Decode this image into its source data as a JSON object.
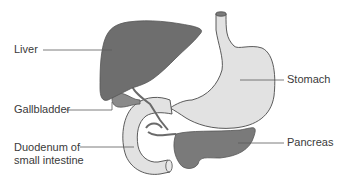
{
  "diagram": {
    "labels": {
      "liver": "Liver",
      "gallbladder": "Gallbladder",
      "duodenum_line1": "Duodenum of",
      "duodenum_line2": "small intestine",
      "stomach": "Stomach",
      "pancreas": "Pancreas"
    },
    "colors": {
      "liver": "#6e6e6e",
      "gallbladder": "#8a8a8a",
      "stomach": "#e2e2e2",
      "duodenum": "#e2e2e2",
      "pancreas": "#7a7a7a",
      "duct": "#6a6a6a",
      "outline": "#4a4a4a",
      "leader_line": "#5a5a5a",
      "text": "#3a3a3a",
      "background": "#ffffff"
    }
  }
}
